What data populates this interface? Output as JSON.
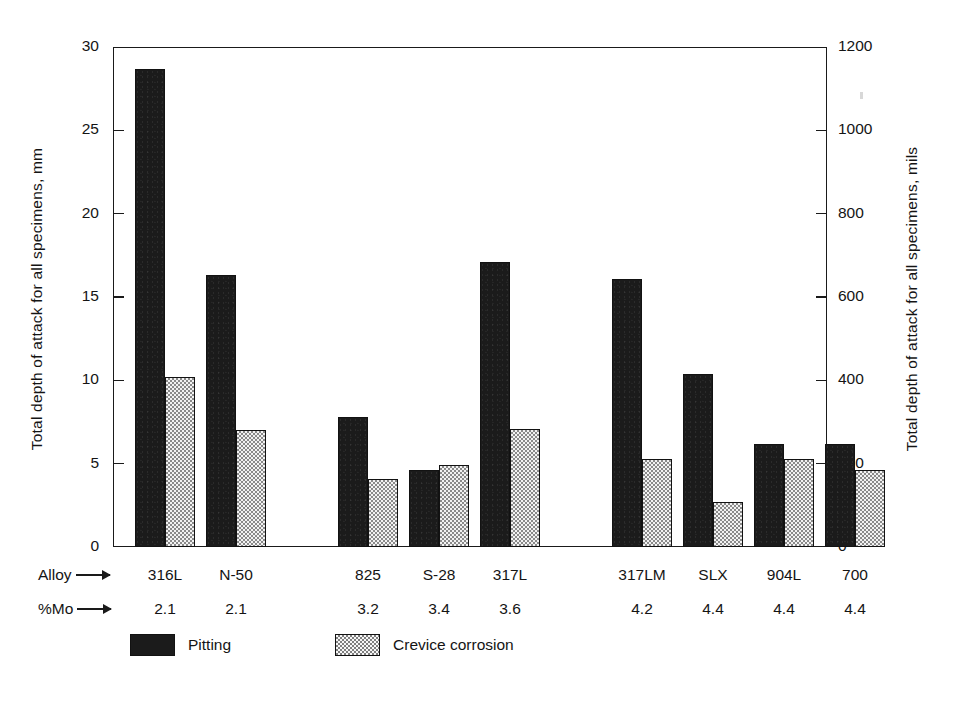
{
  "chart_data": {
    "type": "bar",
    "title": "",
    "ylabel": "Total depth of attack for all specimens, mm",
    "ylabel_right": "Total depth of attack for all specimens, mils",
    "xlabel": "",
    "ylim": [
      0,
      30
    ],
    "ylim_right": [
      0,
      1200
    ],
    "yticks": [
      0,
      5,
      10,
      15,
      20,
      25,
      30
    ],
    "ytick_labels": [
      "0",
      "5",
      "10",
      "15",
      "20",
      "25",
      "30"
    ],
    "yticks_right": [
      0,
      200,
      400,
      600,
      800,
      1000,
      1200
    ],
    "ytick_labels_right": [
      "0",
      "200",
      "400",
      "600",
      "800",
      "1000",
      "1200"
    ],
    "grid": false,
    "legend_position": "below",
    "categories": [
      "316L",
      "N-50",
      "825",
      "S-28",
      "317L",
      "317LM",
      "SLX",
      "904L",
      "700"
    ],
    "row_labels": {
      "category_row": "Alloy",
      "value_row": "%Mo"
    },
    "percent_mo": [
      "2.1",
      "2.1",
      "3.2",
      "3.4",
      "3.6",
      "4.2",
      "4.4",
      "4.4",
      "4.4"
    ],
    "groups": [
      {
        "gap_after": false
      },
      {
        "gap_after": true
      },
      {
        "gap_after": false
      },
      {
        "gap_after": false
      },
      {
        "gap_after": true
      },
      {
        "gap_after": false
      },
      {
        "gap_after": false
      },
      {
        "gap_after": false
      },
      {
        "gap_after": false
      }
    ],
    "series": [
      {
        "name": "Pitting",
        "color": "#1b1b1b",
        "values": [
          28.7,
          16.3,
          7.8,
          4.6,
          17.1,
          16.1,
          10.4,
          6.2,
          6.2
        ]
      },
      {
        "name": "Crevice corrosion",
        "color": "#f2f2f2",
        "values": [
          10.2,
          7.0,
          4.1,
          4.9,
          7.1,
          5.3,
          2.7,
          5.3,
          4.6
        ]
      }
    ]
  },
  "legend": {
    "items": [
      {
        "label": "Pitting",
        "swatch": "pitting-swatch"
      },
      {
        "label": "Crevice corrosion",
        "swatch": "crevice-swatch"
      }
    ]
  },
  "axes": {
    "left_title": "Total depth of attack for all specimens, mm",
    "right_title": "Total depth of attack for all specimens, mils"
  }
}
